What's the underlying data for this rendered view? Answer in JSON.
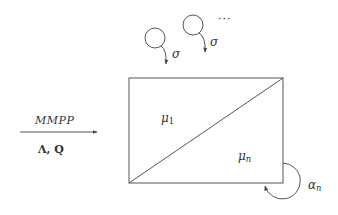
{
  "diagram": {
    "type": "queueing-model",
    "input": {
      "process_label": "MMPP",
      "parameters_label": "Λ, Q"
    },
    "sources": [
      {
        "id": "source-1",
        "rate_label": "σ"
      },
      {
        "id": "source-2",
        "rate_label": "σ"
      }
    ],
    "ellipsis": "···",
    "server_box": {
      "upper_label_base": "μ",
      "upper_label_sub": "1",
      "lower_label_base": "μ",
      "lower_label_sub": "n"
    },
    "self_loop": {
      "label_base": "α",
      "label_sub": "n"
    },
    "colors": {
      "stroke": "#555555",
      "text": "#333333",
      "background": "#ffffff"
    }
  }
}
